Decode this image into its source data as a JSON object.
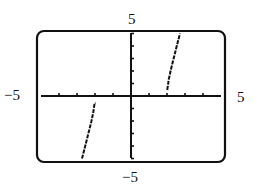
{
  "chart_data": {
    "type": "line",
    "title": "",
    "xlabel": "",
    "ylabel": "",
    "xlim": [
      -5,
      5
    ],
    "ylim": [
      -5,
      5
    ],
    "x_scale_ticks": 1,
    "y_scale_ticks": 1,
    "grid": false,
    "legend": null,
    "window_labels": {
      "xmin": "−5",
      "xmax": "5",
      "ymin": "−5",
      "ymax": "5"
    },
    "series": [
      {
        "name": "right-branch",
        "x": [
          1.97,
          2.02,
          2.1,
          2.2,
          2.3,
          2.4,
          2.5,
          2.6,
          2.72
        ],
        "y": [
          0.6,
          0.57,
          1.34,
          2.02,
          2.61,
          3.18,
          3.75,
          4.32,
          5.0
        ]
      },
      {
        "name": "left-branch",
        "x": [
          -2.72,
          -2.6,
          -2.5,
          -2.4,
          -2.3,
          -2.2,
          -2.1,
          -2.02,
          -1.97
        ],
        "y": [
          -5.0,
          -4.32,
          -3.75,
          -3.18,
          -2.61,
          -2.02,
          -1.34,
          -0.57,
          -0.6
        ]
      }
    ],
    "stroke_color": "#111111"
  }
}
